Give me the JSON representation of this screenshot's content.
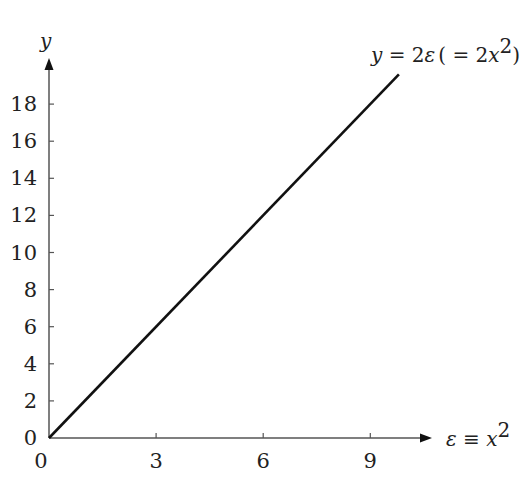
{
  "chart_data": {
    "type": "line",
    "title": "",
    "xlabel": "ε ≡ x²",
    "ylabel": "y",
    "xlim": [
      0,
      10.5
    ],
    "ylim": [
      0,
      20
    ],
    "x_ticks": [
      "0",
      "3",
      "6",
      "9"
    ],
    "y_ticks": [
      "0",
      "2",
      "4",
      "6",
      "8",
      "10",
      "12",
      "14",
      "16",
      "18"
    ],
    "grid": false,
    "series": [
      {
        "name": "y = 2ε (= 2x²)",
        "x": [
          0,
          9.8
        ],
        "y": [
          0,
          19.6
        ]
      }
    ],
    "annotations": [
      {
        "text_parts": [
          "y",
          " = 2",
          "ε",
          " ( = 2",
          "x",
          "2",
          ")"
        ],
        "position": "top-right, at end of line"
      }
    ],
    "colors": {
      "line": "#111111",
      "axis": "#555555",
      "text": "#222222"
    }
  },
  "labels": {
    "y_axis": "y",
    "x_axis_eps": "ε",
    "x_axis_equiv": " ≡ ",
    "x_axis_x": "x",
    "x_axis_sup": "2",
    "origin_x": "0",
    "anno_y": "y",
    "anno_eq": " = 2",
    "anno_eps": "ε",
    "anno_paren": "( = 2",
    "anno_x": "x",
    "anno_sup": "2",
    "anno_close": ")"
  }
}
